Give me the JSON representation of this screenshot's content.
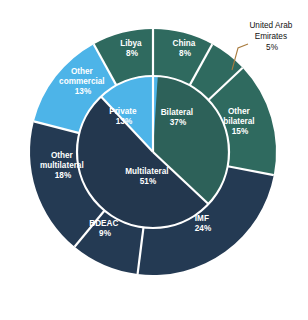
{
  "figure": {
    "background_color": "#ffffff",
    "width": 308,
    "height": 320
  },
  "palette": {
    "bilateral_teal": "#2d6159",
    "bilateral_teal_outer": "#2f6a5f",
    "multilateral_navy": "#23374e",
    "multilateral_navy_outer": "#243a53",
    "private_blue": "#4db4e8",
    "separator": "#ffffff",
    "leader_line": "#a97c3f",
    "label_text": "#ffffff",
    "callout_text": "#111111"
  },
  "callout": {
    "name": "United Arab Emirates",
    "line1": "United Arab",
    "line2": "Emirates",
    "line3": "5%",
    "value": 5
  },
  "chart_data": {
    "type": "pie",
    "title": "",
    "subtitle": "",
    "xlabel": "",
    "ylabel": "",
    "units": "percent",
    "legend": "none",
    "grid": false,
    "layout": "two-level nested donut; inner ring = creditor category, outer ring = individual creditor",
    "start_angle_deg": 0,
    "direction": "clockwise",
    "inner_ring": {
      "name": "Creditor category",
      "labels": [
        "Bilateral",
        "Multilateral",
        "Private"
      ],
      "values": [
        37,
        51,
        13
      ],
      "colors": [
        "#2d6159",
        "#23374e",
        "#4db4e8"
      ]
    },
    "outer_ring": {
      "name": "Creditor",
      "labels": [
        "China",
        "United Arab Emirates",
        "Other bilateral",
        "IMF",
        "BDEAC",
        "Other multilateral",
        "Other commercial",
        "Libya"
      ],
      "values": [
        8,
        5,
        15,
        24,
        9,
        18,
        13,
        8
      ],
      "colors": [
        "#2f6a5f",
        "#2f6a5f",
        "#2f6a5f",
        "#243a53",
        "#243a53",
        "#243a53",
        "#4db4e8",
        "#2f6a5f"
      ],
      "parents": [
        "Bilateral",
        "Bilateral",
        "Bilateral",
        "Multilateral",
        "Multilateral",
        "Multilateral",
        "Private",
        "Bilateral"
      ]
    },
    "annotations": [
      {
        "text": "United Arab Emirates 5%",
        "target": "United Arab Emirates",
        "style": "external leader line"
      }
    ]
  },
  "labels": {
    "inner": [
      {
        "name": "Bilateral",
        "pct": "37%",
        "line1": "Bilateral",
        "line2": "37%"
      },
      {
        "name": "Multilateral",
        "pct": "51%",
        "line1": "Multilateral",
        "line2": "51%"
      },
      {
        "name": "Private",
        "pct": "13%",
        "line1": "Private",
        "line2": "13%"
      }
    ],
    "outer": [
      {
        "name": "China",
        "pct": "8%",
        "line1": "China",
        "line2": "8%"
      },
      {
        "name": "Other bilateral",
        "pct": "15%",
        "line1": "Other",
        "line2": "bilateral",
        "line3": "15%"
      },
      {
        "name": "IMF",
        "pct": "24%",
        "line1": "IMF",
        "line2": "24%"
      },
      {
        "name": "BDEAC",
        "pct": "9%",
        "line1": "BDEAC",
        "line2": "9%"
      },
      {
        "name": "Other multilateral",
        "pct": "18%",
        "line1": "Other",
        "line2": "multilateral",
        "line3": "18%"
      },
      {
        "name": "Other commercial",
        "pct": "13%",
        "line1": "Other",
        "line2": "commercial",
        "line3": "13%"
      },
      {
        "name": "Libya",
        "pct": "8%",
        "line1": "Libya",
        "line2": "8%"
      }
    ]
  }
}
